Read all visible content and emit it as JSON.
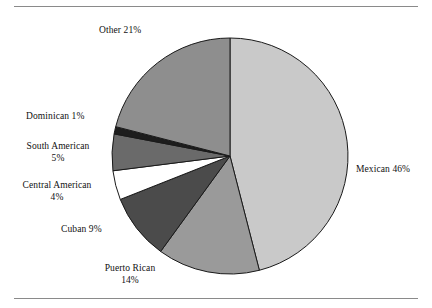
{
  "figure": {
    "has_top_rule": true,
    "has_bottom_rule": true,
    "rule_color": "#8a8a8a",
    "background": "#ffffff"
  },
  "chart_data": {
    "type": "pie",
    "title": "",
    "subtitle": "",
    "xlabel": "",
    "ylabel": "",
    "legend_position": "none",
    "grid": false,
    "labels_outside": true,
    "start_angle_deg": 0,
    "direction": "clockwise",
    "categories": [
      "Mexican",
      "Puerto Rican",
      "Cuban",
      "Central American",
      "South American",
      "Dominican",
      "Other"
    ],
    "values": [
      46,
      14,
      9,
      4,
      5,
      1,
      21
    ],
    "unit": "%",
    "total": 100,
    "slices": [
      {
        "name": "Mexican",
        "value": 46,
        "label": "Mexican 46%",
        "name_text": "Mexican 46%",
        "pct_text": "",
        "color": "#c9c9c9",
        "outline": "#1a1a1a"
      },
      {
        "name": "Puerto Rican",
        "value": 14,
        "label": "Puerto Rican 14%",
        "name_text": "Puerto Rican",
        "pct_text": "14%",
        "color": "#9a9a9a",
        "outline": "#1a1a1a"
      },
      {
        "name": "Cuban",
        "value": 9,
        "label": "Cuban 9%",
        "name_text": "Cuban 9%",
        "pct_text": "",
        "color": "#4b4b4b",
        "outline": "#1a1a1a"
      },
      {
        "name": "Central American",
        "value": 4,
        "label": "Central American 4%",
        "name_text": "Central American",
        "pct_text": "4%",
        "color": "#ffffff",
        "outline": "#1a1a1a"
      },
      {
        "name": "South American",
        "value": 5,
        "label": "South American 5%",
        "name_text": "South  American",
        "pct_text": "5%",
        "color": "#6a6a6a",
        "outline": "#1a1a1a"
      },
      {
        "name": "Dominican",
        "value": 1,
        "label": "Dominican 1%",
        "name_text": "Dominican 1%",
        "pct_text": "",
        "color": "#1d1d1d",
        "outline": "#1a1a1a"
      },
      {
        "name": "Other",
        "value": 21,
        "label": "Other 21%",
        "name_text": "Other 21%",
        "pct_text": "",
        "color": "#8e8e8e",
        "outline": "#1a1a1a"
      }
    ]
  }
}
